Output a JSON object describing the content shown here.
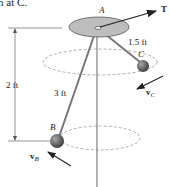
{
  "caption_fragment": "n at C.",
  "labels": {
    "point_a": "A",
    "point_b": "B",
    "point_c": "C",
    "tension": "T",
    "radius_c": "1.5 ft",
    "height": "2 ft",
    "rod_length": "3 ft",
    "velocity_c": "v",
    "velocity_c_sub": "C",
    "velocity_b": "v",
    "velocity_b_sub": "B"
  },
  "colors": {
    "disk_fill": "#bdbdbd",
    "line": "#555555",
    "dashed": "#9a9a9a",
    "ball": "#6e6e6e",
    "text": "#222222"
  }
}
